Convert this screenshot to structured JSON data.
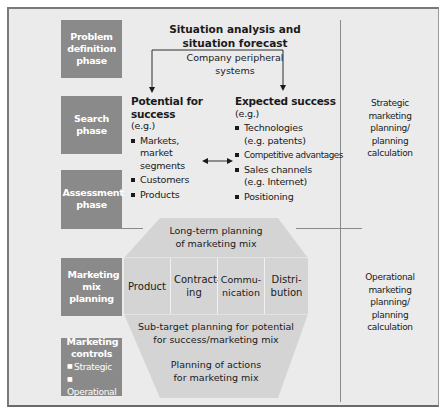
{
  "phases": [
    {
      "label": "Problem definition phase"
    },
    {
      "label": "Search phase"
    },
    {
      "label": "Assessment phase"
    },
    {
      "label": "Marketing mix planning"
    },
    {
      "label": "Marketing controls",
      "items": [
        "Strategic",
        "Operational"
      ]
    }
  ],
  "top": {
    "title_line1": "Situation analysis and",
    "title_line2": "situation forecast",
    "subtitle_line1": "Company peripheral",
    "subtitle_line2": "systems"
  },
  "potential": {
    "heading": "Potential for success",
    "eg": "(e.g.)",
    "items": [
      "Markets, market segments",
      "Customers",
      "Products"
    ]
  },
  "expected": {
    "heading": "Expected success",
    "eg": "(e.g.)",
    "items": [
      "Technologies (e.g. patents)",
      "Competitive advantages",
      "Sales channels (e.g. Internet)",
      "Positioning"
    ]
  },
  "long_term": {
    "line1": "Long-term planning",
    "line2": "of marketing mix"
  },
  "mix": [
    "Product",
    "Contract-ing",
    "Commu-nication",
    "Distri-bution"
  ],
  "sub_target": {
    "line1": "Sub-target planning for potential",
    "line2": "for success/marketing mix"
  },
  "actions": {
    "line1": "Planning of actions",
    "line2": "for marketing mix"
  },
  "side_labels": {
    "strategic": [
      "Strategic",
      "marketing",
      "planning/",
      "planning",
      "calculation"
    ],
    "operational": [
      "Operational",
      "marketing",
      "planning/",
      "planning",
      "calculation"
    ]
  },
  "colors": {
    "phase_box": "#8a8a8a",
    "background": "#ebebeb",
    "hexagon": "#d4d4d4"
  }
}
